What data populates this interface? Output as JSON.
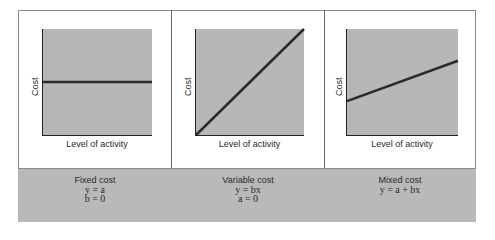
{
  "panels": [
    {
      "id": "fixed",
      "title": "Fixed cost",
      "equations": [
        "y = a",
        "b = 0"
      ],
      "xlabel": "Level of activity",
      "ylabel": "Cost",
      "line": {
        "y_start": 0.5,
        "y_end": 0.5
      }
    },
    {
      "id": "variable",
      "title": "Variable cost",
      "equations": [
        "y = bx",
        "a = 0"
      ],
      "xlabel": "Level of activity",
      "ylabel": "Cost",
      "line": {
        "y_start": 0.0,
        "y_end": 1.0
      }
    },
    {
      "id": "mixed",
      "title": "Mixed cost",
      "equations": [
        "y = a + bx"
      ],
      "xlabel": "Level of activity",
      "ylabel": "Cost",
      "line": {
        "y_start": 0.32,
        "y_end": 0.7
      }
    }
  ],
  "colors": {
    "plot_fill": "#b7b7b7",
    "band_fill": "#b9b9b9",
    "line": "#2b2b2b"
  }
}
